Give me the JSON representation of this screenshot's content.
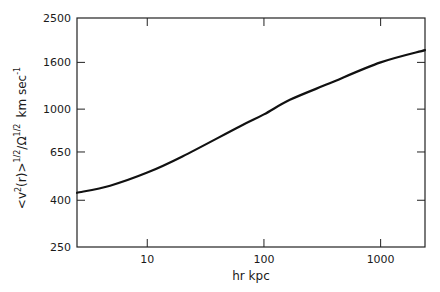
{
  "chart_data": {
    "type": "line",
    "title": "",
    "xlabel": "hr kpc",
    "ylabel": "<v²(r)>^{1/2}/Ω^{1/2} km sec⁻¹",
    "ylabel_parts": {
      "main": "<v",
      "sup1": "2",
      "mid": "(r)>",
      "sup2": "1/2",
      "slash": "/Ω",
      "sup3": "1/2",
      "units": "km sec",
      "sup4": "-1"
    },
    "xscale": "log",
    "yscale": "log",
    "xlim": [
      2.5,
      2400
    ],
    "ylim": [
      250,
      2500
    ],
    "x_ticks": [
      10,
      100,
      1000
    ],
    "x_tick_labels": [
      "10",
      "100",
      "1000"
    ],
    "y_ticks": [
      250,
      400,
      650,
      1000,
      1600,
      2500
    ],
    "y_tick_labels": [
      "250",
      "400",
      "650",
      "1000",
      "1600",
      "2500"
    ],
    "grid": false,
    "legend": null,
    "series": [
      {
        "name": "velocity dispersion",
        "x": [
          2.5,
          4.8,
          10,
          20,
          62,
          100,
          167,
          366,
          1000,
          2400
        ],
        "y": [
          431,
          463,
          528,
          621,
          840,
          948,
          1098,
          1297,
          1600,
          1810
        ]
      }
    ]
  }
}
